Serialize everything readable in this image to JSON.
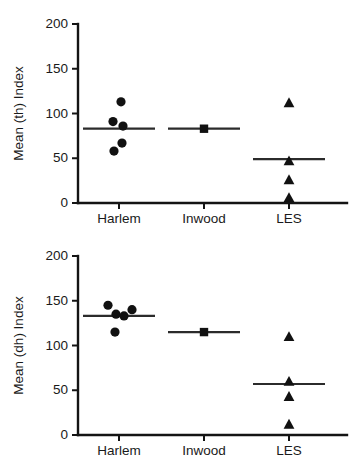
{
  "figure": {
    "title": "",
    "background_color": "#ffffff",
    "marker_color": "#111111",
    "axis_color": "#141414"
  },
  "chart_data": [
    {
      "type": "scatter",
      "panel_id": "th",
      "title": "",
      "xlabel": "",
      "ylabel": "Mean (th) Index",
      "categories": [
        "Harlem",
        "Inwood",
        "LES"
      ],
      "ylim": [
        0,
        200
      ],
      "yticks": [
        0,
        50,
        100,
        150,
        200
      ],
      "ytick_labels": [
        "0",
        "50",
        "100",
        "150",
        "200"
      ],
      "grid": false,
      "legend": "none",
      "groups": [
        {
          "name": "Harlem",
          "marker": "circle",
          "values": [
            113,
            91,
            86,
            67,
            58
          ],
          "jitter": [
            2,
            -6,
            4,
            3,
            -5
          ],
          "mean": 83
        },
        {
          "name": "Inwood",
          "marker": "square",
          "values": [
            83
          ],
          "jitter": [
            0
          ],
          "mean": 83
        },
        {
          "name": "LES",
          "marker": "triangle",
          "values": [
            112,
            47,
            26,
            6
          ],
          "jitter": [
            0,
            0,
            0,
            0
          ],
          "mean": 49
        }
      ]
    },
    {
      "type": "scatter",
      "panel_id": "dh",
      "title": "",
      "xlabel": "",
      "ylabel": "Mean (dh) Index",
      "categories": [
        "Harlem",
        "Inwood",
        "LES"
      ],
      "ylim": [
        0,
        200
      ],
      "yticks": [
        0,
        50,
        100,
        150,
        200
      ],
      "ytick_labels": [
        "0",
        "50",
        "100",
        "150",
        "200"
      ],
      "grid": false,
      "legend": "none",
      "groups": [
        {
          "name": "Harlem",
          "marker": "circle",
          "values": [
            145,
            135,
            133,
            140,
            115
          ],
          "jitter": [
            -11,
            -3,
            5,
            13,
            -4
          ],
          "mean": 133
        },
        {
          "name": "Inwood",
          "marker": "square",
          "values": [
            115
          ],
          "jitter": [
            0
          ],
          "mean": 115
        },
        {
          "name": "LES",
          "marker": "triangle",
          "values": [
            110,
            60,
            43,
            12
          ],
          "jitter": [
            0,
            0,
            0,
            0
          ],
          "mean": 57
        }
      ]
    }
  ]
}
